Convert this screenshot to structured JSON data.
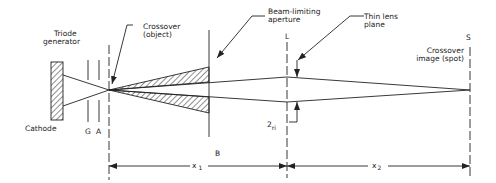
{
  "labels": {
    "triode_line1": "Triode",
    "triode_line2": "generator",
    "crossover_line1": "Crossover",
    "crossover_line2": "(object)",
    "aperture_line1": "Beam-limiting",
    "aperture_line2": "aperture",
    "lens_line1": "Thin lens",
    "lens_line2": "plane",
    "lens_letter": "L",
    "spot_letter": "S",
    "spot_line1": "Crossover",
    "spot_line2": "image (spot)",
    "cathode": "Cathode",
    "grid": "G",
    "anode": "A",
    "aperture_letter": "B",
    "radius_main": "2",
    "radius_sub": "ri",
    "dim1_main": "x",
    "dim1_sub": "1",
    "dim2_main": "x",
    "dim2_sub": "2"
  },
  "colors": {
    "ink": "#222222",
    "background": "#ffffff"
  }
}
